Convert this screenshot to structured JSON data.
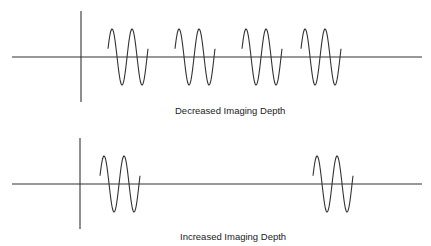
{
  "diagrams": [
    {
      "label": "Decreased Imaging Depth",
      "baseline_y": 57,
      "axis_x": 81,
      "pulses_start_x": [
        108,
        175,
        242,
        301
      ]
    },
    {
      "label": "Increased Imaging Depth",
      "baseline_y": 184,
      "axis_x": 80,
      "pulses_start_x": [
        100,
        313
      ]
    }
  ],
  "caption": {
    "prefix": "Fig. 15",
    "text": "The effect of depth on pulse repetition frequency: decreasing depth increases the PRF"
  },
  "colors": {
    "line": "#333333"
  }
}
